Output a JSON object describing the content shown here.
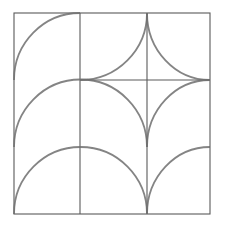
{
  "drawing": {
    "description": "Pencil sketch of a square grid pattern with circular arcs",
    "colors": {
      "background": "#ffffff",
      "grid_line": "#5a5a5a",
      "arc_line": "#6e6e6e"
    },
    "frame": {
      "x1": 14,
      "y1": 13,
      "x2": 210,
      "y2": 214
    },
    "grid_lines": [
      {
        "name": "vertical-line-1",
        "x1": 80,
        "y1": 13,
        "x2": 80,
        "y2": 214
      },
      {
        "name": "vertical-line-2",
        "x1": 147,
        "y1": 13,
        "x2": 147,
        "y2": 214
      },
      {
        "name": "horizontal-line-1",
        "x1": 80,
        "y1": 80,
        "x2": 210,
        "y2": 80
      }
    ],
    "arcs": [
      {
        "name": "arc-top-left",
        "d": "M14,80 A66,67 0 0 1 80,13"
      },
      {
        "name": "arc-middle-left-semicircle",
        "d": "M14,147 A66,67 0 0 1 147,147"
      },
      {
        "name": "arc-top-middle",
        "d": "M80,80 A67,67 0 0 0 147,13"
      },
      {
        "name": "arc-top-right",
        "d": "M147,13 A63,67 0 0 0 210,80"
      },
      {
        "name": "arc-middle-right",
        "d": "M147,147 A63,67 0 0 1 210,80"
      },
      {
        "name": "arc-bottom-left-semicircle",
        "d": "M14,214 A66.5,67 0 0 1 147,214"
      },
      {
        "name": "arc-bottom-right",
        "d": "M147,214 A63,67 0 0 1 210,147"
      }
    ]
  }
}
